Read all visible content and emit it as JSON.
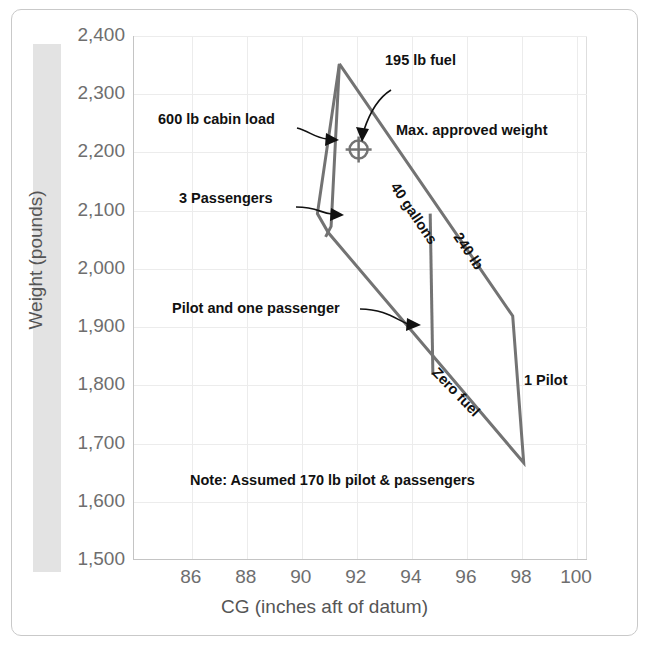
{
  "figure": {
    "border_color": "#c9c9c9",
    "envelope_color": "#737373",
    "grid_color": "#ececec"
  },
  "chart_data": {
    "type": "line",
    "title": "",
    "xlabel": "CG (inches aft of datum)",
    "ylabel": "Weight (pounds)",
    "xlim": [
      83.9,
      100.4
    ],
    "ylim": [
      1500,
      2400
    ],
    "xticks": [
      86,
      88,
      90,
      92,
      94,
      96,
      98,
      100
    ],
    "xtick_labels": [
      "86",
      "88",
      "90",
      "92",
      "94",
      "96",
      "98",
      "100"
    ],
    "yticks": [
      1500,
      1600,
      1700,
      1800,
      1900,
      2000,
      2100,
      2200,
      2300,
      2400
    ],
    "ytick_labels": [
      "1,500",
      "1,600",
      "1,700",
      "1,800",
      "1,900",
      "2,000",
      "2,100",
      "2,200",
      "2,300",
      "2,400"
    ],
    "grid": true,
    "legend": "none",
    "series": [
      {
        "name": "CG envelope (outer limit)",
        "points": [
          [
            91.4,
            2352
          ],
          [
            90.6,
            2095
          ],
          [
            91.0,
            2062
          ],
          [
            98.1,
            1667
          ],
          [
            97.7,
            1919
          ],
          [
            91.4,
            2352
          ]
        ]
      },
      {
        "name": "Forward loading line (600 lb cabin load / 3 passengers)",
        "points": [
          [
            91.4,
            2352
          ],
          [
            91.1,
            2073
          ],
          [
            90.9,
            2055
          ]
        ]
      },
      {
        "name": "Zero fuel / pilot boundary",
        "points": [
          [
            94.7,
            2095
          ],
          [
            94.8,
            1818
          ]
        ]
      }
    ],
    "markers": [
      {
        "name": "loaded-cg-point",
        "symbol": "circle-cross",
        "x": 92.1,
        "y": 2205
      }
    ],
    "annotations": [
      {
        "id": "cabin-load",
        "text": "600 lb cabin load",
        "rotation": 0
      },
      {
        "id": "fuel-195",
        "text": "195 lb fuel",
        "rotation": 0
      },
      {
        "id": "max-weight",
        "text": "Max. approved weight",
        "rotation": 0
      },
      {
        "id": "passengers-3",
        "text": "3 Passengers",
        "rotation": 0
      },
      {
        "id": "gallons-40",
        "text": "40 gallons",
        "rotation": 56
      },
      {
        "id": "lb-240",
        "text": "240 lb",
        "rotation": 56
      },
      {
        "id": "pilot-one-pax",
        "text": "Pilot and one passenger",
        "rotation": 0
      },
      {
        "id": "zero-fuel",
        "text": "Zero fuel",
        "rotation": 46
      },
      {
        "id": "pilot-1",
        "text": "1 Pilot",
        "rotation": 0
      },
      {
        "id": "note",
        "text": "Note: Assumed 170 lb pilot & passengers",
        "rotation": 0
      }
    ]
  },
  "annotations": {
    "cabin_load": "600 lb cabin load",
    "fuel_195": "195 lb fuel",
    "max_weight": "Max. approved weight",
    "passengers_3": "3 Passengers",
    "gallons_40": "40 gallons",
    "lb_240": "240 lb",
    "pilot_one_pax": "Pilot and one passenger",
    "zero_fuel": "Zero fuel",
    "pilot_1": "1 Pilot",
    "note": "Note: Assumed 170 lb pilot & passengers"
  },
  "axes": {
    "x_title": "CG (inches aft of datum)",
    "y_title": "Weight (pounds)"
  }
}
